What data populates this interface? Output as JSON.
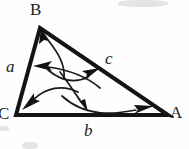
{
  "figure": {
    "kind": "geometry-diagram",
    "background_color": "#fefefe",
    "stroke_color": "#141414",
    "arrow_color": "#1a1a1a"
  },
  "vertices": [
    {
      "id": "B",
      "label": "B",
      "x": 40,
      "y": 28,
      "label_x": 30,
      "label_y": 1
    },
    {
      "id": "C",
      "label": "C",
      "x": 16,
      "y": 115,
      "label_x": -2,
      "label_y": 105
    },
    {
      "id": "A",
      "label": "A",
      "x": 168,
      "y": 115,
      "label_x": 170,
      "label_y": 104
    }
  ],
  "sides": [
    {
      "id": "a",
      "label": "a",
      "between": "C-B",
      "label_x": 6,
      "label_y": 58
    },
    {
      "id": "b",
      "label": "b",
      "between": "C-A",
      "label_x": 84,
      "label_y": 122
    },
    {
      "id": "c",
      "label": "c",
      "between": "B-A",
      "label_x": 105,
      "label_y": 50
    }
  ],
  "triangle": {
    "points": "40,28 16,115 168,115",
    "stroke_width": 4
  },
  "arrows": [
    {
      "id": "arrow-to-B",
      "from": "side-a-midpoint",
      "to": "vertex-B",
      "path": "M 64,79 C 66,60 52,46 45,36",
      "head_at": [
        43,
        33
      ],
      "head_angle": -125
    },
    {
      "id": "arrow-to-side-a",
      "from": "interior",
      "to": "side-a",
      "path": "M 92,86 C 82,76 68,71 42,68",
      "head_at": [
        38,
        67
      ],
      "head_angle": 188
    },
    {
      "id": "arrow-to-side-c",
      "from": "interior",
      "to": "side-c",
      "path": "M 55,72 C 66,79 79,82 92,75",
      "head_at": [
        96,
        71
      ],
      "head_angle": -38
    },
    {
      "id": "arrow-to-vertex-C",
      "from": "interior",
      "to": "vertex-C",
      "path": "M 72,92 C 58,86 44,90 32,102",
      "head_at": [
        28,
        107
      ],
      "head_angle": 135
    },
    {
      "id": "arrow-to-side-b",
      "from": "interior",
      "to": "side-b",
      "path": "M 64,77 C 72,86 76,95 82,103",
      "head_at": [
        85,
        108
      ],
      "head_angle": 58
    },
    {
      "id": "arrow-along-b",
      "from": "interior",
      "to": "vertex-A",
      "path": "M 66,95 C 92,116 122,114 142,110",
      "head_at": [
        147,
        109
      ],
      "head_angle": -12
    }
  ],
  "artifacts": {
    "top_smudge": "scan-smudge",
    "bottom_smudge": "scan-smudge",
    "left_smudge": "scan-smudge"
  }
}
